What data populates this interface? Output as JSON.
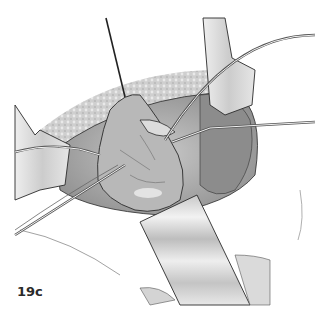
{
  "figure": {
    "label": "19c",
    "colors": {
      "background": "#ffffff",
      "tissue_dark": "#8a8a8a",
      "tissue_mid": "#b5b5b5",
      "tissue_light": "#d8d8d8",
      "outline": "#2a2a2a",
      "retractor": "#cfcfcf"
    }
  }
}
